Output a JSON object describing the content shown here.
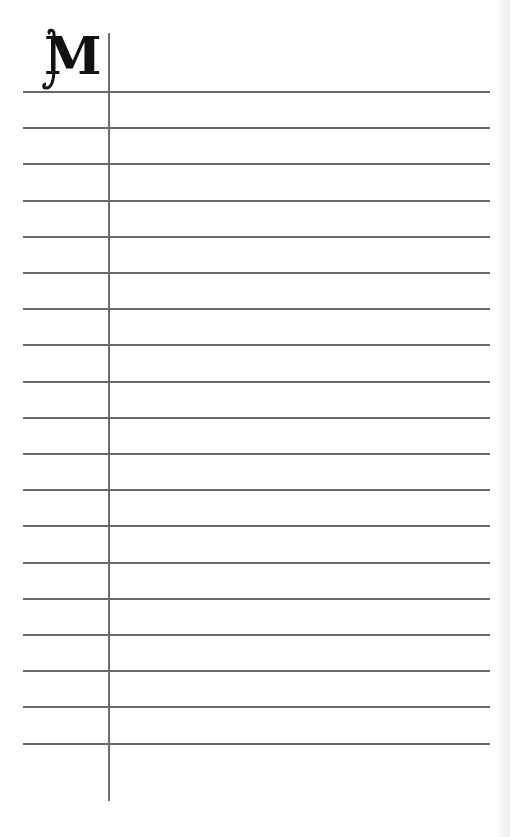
{
  "page": {
    "type": "lined notebook page",
    "monogram_letter": "M",
    "line_color": "#6a6a6a",
    "background": "#ffffff",
    "margin_line_x": 108,
    "rule_count": 19,
    "rule_start_y": 91,
    "rule_spacing": 36.2
  }
}
